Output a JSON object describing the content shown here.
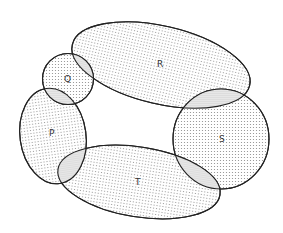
{
  "diagram": {
    "type": "overlapping-sets-ring",
    "sets": [
      {
        "id": "Q",
        "label": "Q"
      },
      {
        "id": "R",
        "label": "R"
      },
      {
        "id": "S",
        "label": "S"
      },
      {
        "id": "T",
        "label": "T"
      },
      {
        "id": "P",
        "label": "P"
      }
    ],
    "overlaps": [
      [
        "Q",
        "R"
      ],
      [
        "R",
        "S"
      ],
      [
        "S",
        "T"
      ],
      [
        "T",
        "P"
      ],
      [
        "P",
        "Q"
      ]
    ],
    "colors": {
      "stroke": "#222222",
      "dot": "#8a8a8a",
      "background": "#ffffff"
    }
  }
}
